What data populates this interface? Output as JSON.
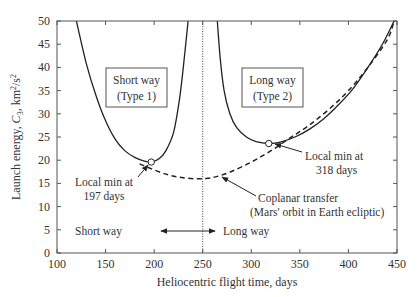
{
  "chart_data": {
    "type": "line",
    "title": "",
    "xlabel": "Heliocentric flight time, days",
    "ylabel": "Launch energy, C3, km²/s²",
    "xlim": [
      100,
      450
    ],
    "ylim": [
      0,
      50
    ],
    "xticks": [
      100,
      150,
      200,
      250,
      300,
      350,
      400,
      450
    ],
    "yticks": [
      0,
      5,
      10,
      15,
      20,
      25,
      30,
      35,
      40,
      45,
      50
    ],
    "grid": false,
    "legend": null,
    "series": [
      {
        "name": "Short way (Type 1)",
        "style": "solid",
        "x": [
          120,
          130,
          140,
          150,
          160,
          170,
          180,
          190,
          197,
          205,
          212,
          220,
          226,
          230,
          233,
          235
        ],
        "y": [
          50,
          41,
          34,
          28.5,
          24.5,
          22,
          20.6,
          19.8,
          19.6,
          20.3,
          22,
          26,
          33,
          40,
          46,
          50
        ]
      },
      {
        "name": "Long way (Type 2)",
        "style": "solid",
        "x": [
          265,
          268,
          272,
          278,
          285,
          295,
          305,
          318,
          330,
          345,
          360,
          375,
          390,
          405,
          420,
          435,
          447
        ],
        "y": [
          50,
          42,
          35,
          30,
          27,
          25,
          24,
          23.6,
          23.9,
          25,
          26.7,
          29,
          32,
          35.5,
          40,
          45,
          50
        ]
      },
      {
        "name": "Coplanar transfer (Mars' orbit in Earth ecliptic)",
        "style": "dashed",
        "x": [
          185,
          200,
          215,
          230,
          245,
          255,
          265,
          280,
          300,
          320,
          340,
          360,
          380,
          400,
          420,
          440,
          447
        ],
        "y": [
          19.2,
          17.9,
          16.8,
          16.2,
          16.0,
          16.1,
          16.5,
          17.6,
          19.6,
          22,
          24.8,
          27.6,
          31,
          35,
          40,
          46,
          50
        ]
      }
    ],
    "markers": [
      {
        "x": 197,
        "y": 19.6,
        "shape": "open-circle"
      },
      {
        "x": 318,
        "y": 23.6,
        "shape": "open-circle"
      }
    ],
    "vertical_line": {
      "x": 250,
      "style": "dotted"
    },
    "annotations": {
      "short_box": [
        "Short way",
        "(Type 1)"
      ],
      "long_box": [
        "Long way",
        "(Type 2)"
      ],
      "local_min_short": [
        "Local min at",
        "197 days"
      ],
      "local_min_long": [
        "Local min at",
        "318 days"
      ],
      "coplanar": [
        "Coplanar transfer",
        "(Mars' orbit in Earth ecliptic)"
      ],
      "short_way_arrow": "Short way",
      "long_way_arrow": "Long way"
    }
  }
}
